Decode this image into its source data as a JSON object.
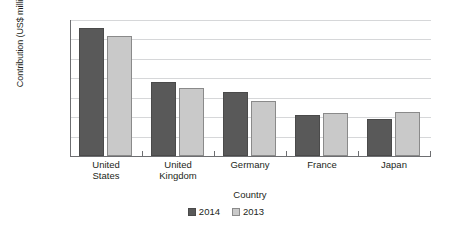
{
  "chart_data": {
    "type": "bar",
    "title": "",
    "xlabel": "Country",
    "ylabel": "Contribution (US$ millions)",
    "categories": [
      "United States",
      "United Kingdom",
      "Germany",
      "France",
      "Japan"
    ],
    "category_lines": [
      [
        "United",
        "States"
      ],
      [
        "United",
        "Kingdom"
      ],
      [
        "Germany"
      ],
      [
        "France"
      ],
      [
        "Japan"
      ]
    ],
    "series": [
      {
        "name": "2014",
        "color": "#595959",
        "values": [
          33000,
          19000,
          16500,
          10500,
          9400
        ]
      },
      {
        "name": "2013",
        "color": "#c9c9c9",
        "values": [
          31000,
          17500,
          14200,
          11000,
          11200
        ]
      }
    ],
    "ylim": [
      0,
      35000
    ],
    "ytick_values": [
      0,
      5000,
      10000,
      15000,
      20000,
      25000,
      30000,
      35000
    ],
    "ytick_labels": [
      "0",
      "5,000",
      "10,000",
      "15,000",
      "20,000",
      "25,000",
      "30,000",
      "35,000"
    ],
    "grid": true,
    "legend_position": "bottom"
  }
}
